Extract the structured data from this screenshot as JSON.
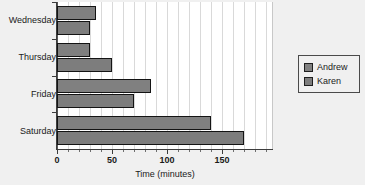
{
  "chart_data": {
    "type": "bar",
    "orientation": "horizontal",
    "title": "",
    "xlabel": "Time (minutes)",
    "ylabel": "",
    "categories": [
      "Wednesday",
      "Thursday",
      "Friday",
      "Saturday"
    ],
    "series": [
      {
        "name": "Andrew",
        "color": "#808080",
        "values": [
          35,
          30,
          85,
          140
        ]
      },
      {
        "name": "Karen",
        "color": "#7d7d7d",
        "values": [
          30,
          50,
          70,
          170
        ]
      }
    ],
    "xlim": [
      0,
      196
    ],
    "xticks": [
      0,
      50,
      100,
      150
    ],
    "xtick_labels": [
      "0",
      "50",
      "100",
      "150"
    ],
    "xtick_minor_step": 10,
    "grid": "vertical",
    "legend_position": "right",
    "legend_entries": [
      "Andrew",
      "Karen"
    ]
  },
  "colors": {
    "background": "#f0f0f0",
    "plot_background": "#ffffff",
    "gridline": "#d9d9d9",
    "axis": "#3c3c3c",
    "bar_outline": "#141414",
    "text": "#1a1a1a"
  }
}
